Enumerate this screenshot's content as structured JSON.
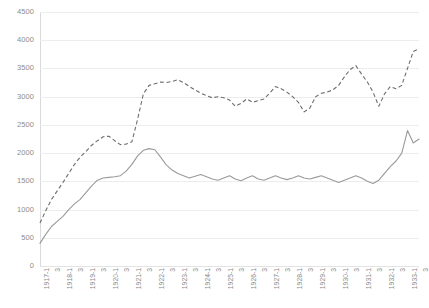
{
  "chart_data": {
    "type": "line",
    "title": "",
    "subtitle": "",
    "xlabel": "",
    "ylabel": "",
    "ylim": [
      0,
      4500
    ],
    "ytick_step": 500,
    "yticks": [
      0,
      500,
      1000,
      1500,
      2000,
      2500,
      3000,
      3500,
      4000,
      4500
    ],
    "ytick_labels": [
      "0",
      "500",
      "1000",
      "1500",
      "2000",
      "2500",
      "3000",
      "3500",
      "4000",
      "4500"
    ],
    "grid": true,
    "grid_axis": "y",
    "legend": false,
    "legend_position": "none",
    "annotations": [],
    "x_tick_labels": [
      "1917-1",
      "3",
      "1918-1",
      "3",
      "1919-1",
      "3",
      "1920-1",
      "3",
      "1921-1",
      "3",
      "1922-1",
      "3",
      "1923-1",
      "3",
      "1924-1",
      "3",
      "1925-1",
      "3",
      "1926-1",
      "3",
      "1927-1",
      "3",
      "1928-1",
      "3",
      "1929-1",
      "3",
      "1930-1",
      "3",
      "1931-1",
      "3",
      "1932-1",
      "3",
      "1933-1",
      "3"
    ],
    "x": [
      "1917-1",
      "1917-2",
      "1917-3",
      "1917-4",
      "1918-1",
      "1918-2",
      "1918-3",
      "1918-4",
      "1919-1",
      "1919-2",
      "1919-3",
      "1919-4",
      "1920-1",
      "1920-2",
      "1920-3",
      "1920-4",
      "1921-1",
      "1921-2",
      "1921-3",
      "1921-4",
      "1922-1",
      "1922-2",
      "1922-3",
      "1922-4",
      "1923-1",
      "1923-2",
      "1923-3",
      "1923-4",
      "1924-1",
      "1924-2",
      "1924-3",
      "1924-4",
      "1925-1",
      "1925-2",
      "1925-3",
      "1925-4",
      "1926-1",
      "1926-2",
      "1926-3",
      "1926-4",
      "1927-1",
      "1927-2",
      "1927-3",
      "1927-4",
      "1928-1",
      "1928-2",
      "1928-3",
      "1928-4",
      "1929-1",
      "1929-2",
      "1929-3",
      "1929-4",
      "1930-1",
      "1930-2",
      "1930-3",
      "1930-4",
      "1931-1",
      "1931-2",
      "1931-3",
      "1931-4",
      "1932-1",
      "1932-2",
      "1932-3",
      "1932-4",
      "1933-1",
      "1933-2",
      "1933-3"
    ],
    "series": [
      {
        "name": "upper-dashed-series",
        "style": "dashed",
        "color": "#6e6e6e",
        "values": [
          760,
          980,
          1180,
          1330,
          1480,
          1640,
          1800,
          1930,
          2030,
          2140,
          2220,
          2290,
          2300,
          2220,
          2150,
          2160,
          2200,
          2600,
          3050,
          3200,
          3230,
          3260,
          3250,
          3270,
          3300,
          3250,
          3180,
          3120,
          3060,
          3020,
          2980,
          3000,
          2980,
          2940,
          2830,
          2880,
          2960,
          2900,
          2930,
          2960,
          3060,
          3180,
          3140,
          3080,
          3000,
          2900,
          2730,
          2800,
          3000,
          3060,
          3080,
          3120,
          3200,
          3350,
          3480,
          3550,
          3400,
          3260,
          3080,
          2830,
          3050,
          3180,
          3140,
          3200,
          3500,
          3800,
          3850
        ]
      },
      {
        "name": "lower-solid-series",
        "style": "solid",
        "color": "#9a9a9a",
        "values": [
          400,
          560,
          700,
          790,
          880,
          1000,
          1100,
          1180,
          1300,
          1420,
          1520,
          1560,
          1570,
          1580,
          1600,
          1680,
          1800,
          1950,
          2050,
          2080,
          2060,
          1930,
          1790,
          1700,
          1640,
          1600,
          1560,
          1590,
          1620,
          1580,
          1540,
          1520,
          1560,
          1600,
          1540,
          1510,
          1560,
          1600,
          1540,
          1520,
          1560,
          1600,
          1560,
          1530,
          1560,
          1600,
          1560,
          1540,
          1570,
          1600,
          1560,
          1520,
          1480,
          1520,
          1560,
          1600,
          1560,
          1500,
          1460,
          1520,
          1640,
          1760,
          1860,
          2000,
          2400,
          2180,
          2250
        ]
      }
    ]
  }
}
